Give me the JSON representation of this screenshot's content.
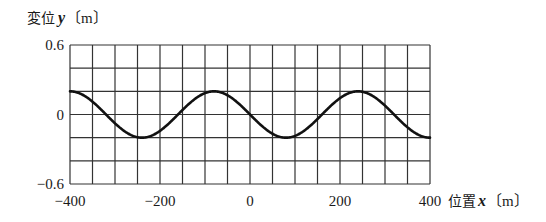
{
  "chart_data": {
    "type": "line",
    "title": "",
    "ylabel": "変位 y〔m〕",
    "ylabel_parts": {
      "prefix": "変位",
      "var": "y",
      "unit": "〔m〕"
    },
    "xlabel": "位置 x〔m〕",
    "xlabel_parts": {
      "prefix": "位置",
      "var": "x",
      "unit": "〔m〕"
    },
    "xlim": [
      -400,
      400
    ],
    "ylim": [
      -0.6,
      0.6
    ],
    "xticks": [
      -400,
      -200,
      0,
      200,
      400
    ],
    "xtick_labels": [
      "−400",
      "−200",
      "0",
      "200",
      "400"
    ],
    "yticks": [
      0.6,
      0,
      -0.6
    ],
    "ytick_labels": [
      "0.6",
      "0",
      "−0.6"
    ],
    "grid": {
      "on": true,
      "x_step": 50,
      "y_step": 0.2
    },
    "legend": null,
    "series": [
      {
        "name": "displacement",
        "description": "sinusoidal wave, amplitude 0.2 m, wavelength ~320 m",
        "amplitude": 0.2,
        "wavelength": 320,
        "x": [
          -400,
          -360,
          -320,
          -280,
          -240,
          -200,
          -160,
          -120,
          -80,
          -40,
          0,
          40,
          80,
          120,
          160,
          200,
          240,
          280,
          320,
          360,
          400
        ],
        "y": [
          0.2,
          0.141,
          0.0,
          -0.141,
          -0.2,
          -0.141,
          0.0,
          0.141,
          0.2,
          0.141,
          0.0,
          -0.141,
          -0.2,
          -0.141,
          0.0,
          0.141,
          0.2,
          0.141,
          0.0,
          -0.141,
          -0.2
        ]
      }
    ]
  }
}
